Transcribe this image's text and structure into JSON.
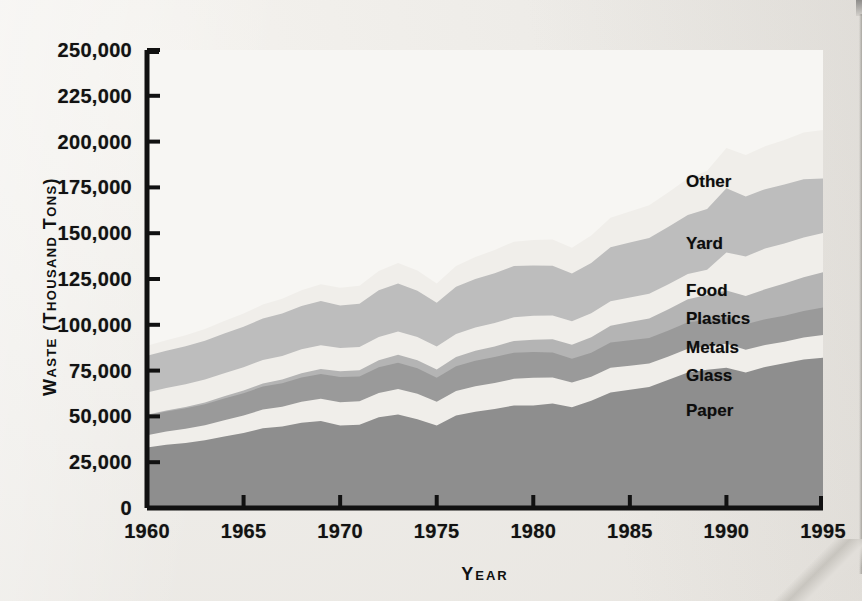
{
  "figure": {
    "y_axis_title": "Waste (Thousand Tons)",
    "x_axis_title": "Year"
  },
  "axes": {
    "y_ticks": [
      "0",
      "25,000",
      "50,000",
      "75,000",
      "100,000",
      "125,000",
      "150,000",
      "175,000",
      "200,000",
      "225,000",
      "250,000"
    ],
    "x_ticks": [
      "1960",
      "1965",
      "1970",
      "1975",
      "1980",
      "1985",
      "1990",
      "1995"
    ]
  },
  "series_labels": [
    {
      "name": "Other",
      "label": "Other"
    },
    {
      "name": "Yard",
      "label": "Yard"
    },
    {
      "name": "Food",
      "label": "Food"
    },
    {
      "name": "Plastics",
      "label": "Plastics"
    },
    {
      "name": "Metals",
      "label": "Metals"
    },
    {
      "name": "Glass",
      "label": "Glass"
    },
    {
      "name": "Paper",
      "label": "Paper"
    }
  ],
  "colors": {
    "paper": "#8e8e8e",
    "glass": "#f0eeea",
    "metals": "#9a9a9a",
    "plastics": "#b4b4b4",
    "food": "#f0eeea",
    "yard": "#bdbdbd",
    "other": "#f0eeea",
    "top_band": "#a8a8a8",
    "axis": "#111111",
    "plot_bg": "#f7f6f3"
  },
  "chart_data": {
    "type": "area",
    "title": "",
    "subtitle": "",
    "xlabel": "Year",
    "ylabel": "Waste (Thousand Tons)",
    "xlim": [
      1960,
      1995
    ],
    "ylim": [
      0,
      250000
    ],
    "grid": false,
    "stacked": true,
    "legend_position": "inline-right",
    "x": [
      1960,
      1961,
      1962,
      1963,
      1964,
      1965,
      1966,
      1967,
      1968,
      1969,
      1970,
      1971,
      1972,
      1973,
      1974,
      1975,
      1976,
      1977,
      1978,
      1979,
      1980,
      1981,
      1982,
      1983,
      1984,
      1985,
      1986,
      1987,
      1988,
      1989,
      1990,
      1991,
      1992,
      1993,
      1994,
      1995
    ],
    "series": [
      {
        "name": "Paper",
        "values": [
          33000,
          34500,
          35500,
          37000,
          39000,
          41000,
          43500,
          44500,
          46500,
          47500,
          45000,
          45500,
          49500,
          51000,
          48500,
          45000,
          50500,
          52500,
          54000,
          56000,
          56000,
          57000,
          55000,
          58500,
          63000,
          64500,
          66000,
          70000,
          74000,
          75500,
          76500,
          74000,
          77000,
          79000,
          81000,
          82000
        ]
      },
      {
        "name": "Glass",
        "values": [
          6700,
          7200,
          7700,
          8200,
          8900,
          9500,
          10200,
          10800,
          11500,
          12100,
          12700,
          12800,
          13300,
          13900,
          13800,
          13000,
          13400,
          14000,
          14200,
          14500,
          15100,
          14300,
          13500,
          13100,
          13500,
          13200,
          12900,
          12700,
          12900,
          12700,
          13100,
          12400,
          12000,
          11800,
          12000,
          12500
        ]
      },
      {
        "name": "Metals",
        "values": [
          10800,
          11000,
          11200,
          11500,
          11900,
          12200,
          12600,
          12800,
          13200,
          13500,
          13800,
          13500,
          14000,
          14400,
          14000,
          13100,
          13500,
          13900,
          14200,
          14300,
          14000,
          13600,
          13000,
          13200,
          13800,
          13900,
          13900,
          14200,
          14500,
          14400,
          14500,
          13900,
          14000,
          14200,
          14600,
          15000
        ]
      },
      {
        "name": "Plastics",
        "values": [
          400,
          500,
          700,
          900,
          1200,
          1400,
          1700,
          2000,
          2400,
          2800,
          3100,
          3400,
          3900,
          4300,
          4300,
          4500,
          5000,
          5400,
          5800,
          6400,
          6800,
          7200,
          7600,
          8400,
          9200,
          9900,
          10700,
          11600,
          12600,
          13600,
          14600,
          15400,
          16400,
          17500,
          18400,
          19200
        ]
      },
      {
        "name": "Food",
        "values": [
          12200,
          12300,
          12400,
          12500,
          12600,
          12700,
          12800,
          12900,
          13000,
          13000,
          12800,
          12700,
          12700,
          12800,
          12700,
          12500,
          12600,
          12700,
          12800,
          12900,
          13000,
          13000,
          12900,
          13100,
          13300,
          13400,
          13500,
          13600,
          13700,
          13800,
          20800,
          21600,
          22200,
          21900,
          21700,
          21400
        ]
      },
      {
        "name": "Yard",
        "values": [
          20000,
          20400,
          20800,
          21200,
          21700,
          22100,
          22600,
          23100,
          23600,
          24100,
          23200,
          23600,
          25500,
          26200,
          25300,
          24000,
          25800,
          26500,
          27200,
          28000,
          27500,
          27200,
          26000,
          27500,
          29500,
          30000,
          30400,
          31400,
          32300,
          33200,
          35000,
          32800,
          32400,
          32200,
          31800,
          29800
        ]
      },
      {
        "name": "Other",
        "values": [
          5400,
          5700,
          6000,
          6400,
          6800,
          7200,
          7700,
          8100,
          8600,
          9100,
          9600,
          9800,
          10500,
          11200,
          11000,
          10500,
          11300,
          12000,
          12600,
          13300,
          13900,
          14200,
          14000,
          15000,
          16200,
          17000,
          17800,
          18800,
          19800,
          20900,
          22000,
          22600,
          23400,
          24300,
          25400,
          26500
        ]
      }
    ]
  }
}
